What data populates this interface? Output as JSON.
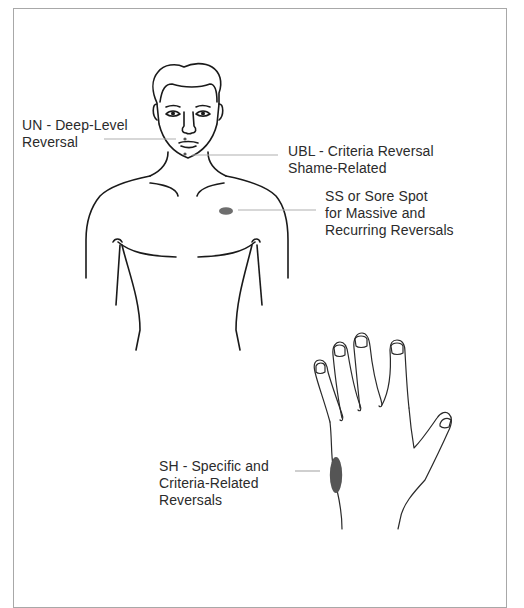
{
  "diagram": {
    "labels": {
      "un": {
        "code": "UN",
        "lines": [
          "UN - Deep-Level",
          "Reversal"
        ]
      },
      "ubl": {
        "code": "UBL",
        "lines": [
          "UBL - Criteria Reversal",
          "Shame-Related"
        ]
      },
      "ss": {
        "code": "SS",
        "lines": [
          "SS or Sore Spot",
          "for Massive and",
          "Recurring Reversals"
        ]
      },
      "sh": {
        "code": "SH",
        "lines": [
          "SH - Specific and",
          "Criteria-Related",
          "Reversals"
        ]
      }
    },
    "colors": {
      "line_art": "#1a1a1a",
      "leader_line": "#b0b0b0",
      "marker_ss": "#6e6e6e",
      "marker_sh": "#555555",
      "frame": "#a8a8a8",
      "text": "#2b2b2b"
    }
  }
}
